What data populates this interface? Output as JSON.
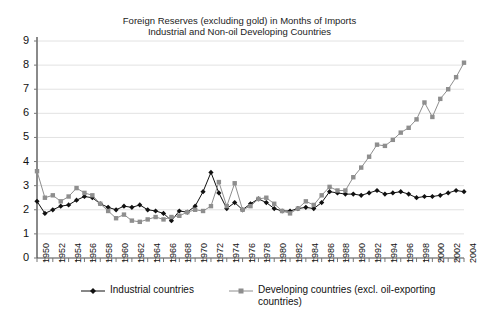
{
  "chart_data": {
    "type": "line",
    "title": "Foreign Reserves (excluding gold) in Months of Imports",
    "subtitle": "Industrial and Non-oil Developing Countries",
    "xlabel": "",
    "ylabel": "",
    "ylim": [
      0,
      9
    ],
    "yticks": [
      0,
      1,
      2,
      3,
      4,
      5,
      6,
      7,
      8,
      9
    ],
    "xlim": [
      1950,
      2004
    ],
    "grid": true,
    "legend_position": "bottom",
    "x": [
      1950,
      1951,
      1952,
      1953,
      1954,
      1955,
      1956,
      1957,
      1958,
      1959,
      1960,
      1961,
      1962,
      1963,
      1964,
      1965,
      1966,
      1967,
      1968,
      1969,
      1970,
      1971,
      1972,
      1973,
      1974,
      1975,
      1976,
      1977,
      1978,
      1979,
      1980,
      1981,
      1982,
      1983,
      1984,
      1985,
      1986,
      1987,
      1988,
      1989,
      1990,
      1991,
      1992,
      1993,
      1994,
      1995,
      1996,
      1997,
      1998,
      1999,
      2000,
      2001,
      2002,
      2003,
      2004
    ],
    "xtick_labels": [
      "1950",
      "1952",
      "1954",
      "1956",
      "1958",
      "1960",
      "1962",
      "1964",
      "1966",
      "1968",
      "1970",
      "1972",
      "1974",
      "1976",
      "1978",
      "1980",
      "1982",
      "1984",
      "1986",
      "1988",
      "1990",
      "1992",
      "1994",
      "1996",
      "1998",
      "2000",
      "2002",
      "2004"
    ],
    "series": [
      {
        "name": "Industrial countries",
        "color": "#111111",
        "marker": "diamond",
        "values": [
          2.35,
          1.85,
          2.0,
          2.15,
          2.2,
          2.4,
          2.55,
          2.5,
          2.25,
          2.1,
          2.0,
          2.15,
          2.1,
          2.2,
          2.0,
          1.95,
          1.85,
          1.55,
          1.95,
          1.9,
          2.15,
          2.75,
          3.55,
          2.7,
          2.05,
          2.3,
          2.0,
          2.25,
          2.45,
          2.3,
          2.05,
          1.95,
          1.95,
          2.05,
          2.1,
          2.05,
          2.3,
          2.75,
          2.7,
          2.65,
          2.65,
          2.6,
          2.7,
          2.8,
          2.65,
          2.7,
          2.75,
          2.65,
          2.5,
          2.55,
          2.55,
          2.6,
          2.7,
          2.8,
          2.75
        ]
      },
      {
        "name": "Developing countries (excl. oil-exporting countries)",
        "color": "#8e8e8e",
        "marker": "square",
        "values": [
          3.6,
          2.5,
          2.6,
          2.35,
          2.55,
          2.9,
          2.7,
          2.6,
          2.25,
          1.95,
          1.65,
          1.8,
          1.55,
          1.5,
          1.6,
          1.7,
          1.6,
          1.7,
          1.75,
          1.9,
          2.0,
          1.95,
          2.15,
          3.15,
          2.15,
          3.1,
          2.0,
          2.15,
          2.45,
          2.5,
          2.25,
          1.95,
          1.85,
          2.05,
          2.35,
          2.2,
          2.6,
          2.95,
          2.8,
          2.8,
          3.35,
          3.75,
          4.2,
          4.7,
          4.65,
          4.9,
          5.2,
          5.4,
          5.75,
          6.45,
          5.85,
          6.6,
          7.0,
          7.5,
          8.1
        ]
      }
    ]
  }
}
